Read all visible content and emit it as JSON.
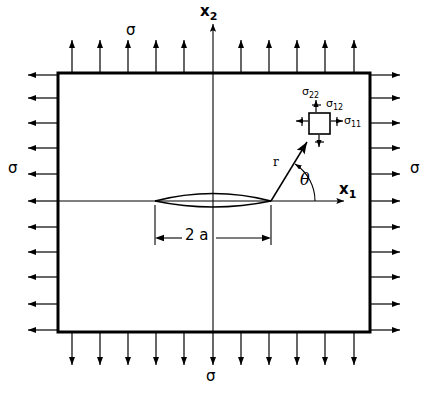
{
  "figure": {
    "type": "engineering-diagram",
    "colors": {
      "ink": "#000000",
      "background": "#ffffff"
    },
    "plate": {
      "x": 58,
      "y": 73,
      "width": 312,
      "height": 259,
      "border_width": 3
    },
    "crack": {
      "half_length_label": "2 a",
      "left_tip_x": 155,
      "right_tip_x": 271,
      "center_y": 201,
      "opening": 11
    },
    "axes": {
      "x1": {
        "label": "x",
        "subscript": "1",
        "from_x": 58,
        "to_x": 347,
        "y": 201
      },
      "x2": {
        "label": "x",
        "subscript": "2",
        "x": 213,
        "from_y": 332,
        "to_y": 22
      }
    },
    "remote_stress": {
      "symbol": "σ",
      "top_label": "σ",
      "bottom_label": "σ",
      "left_label": "σ",
      "right_label": "σ",
      "top_arrow_count": 10,
      "bottom_arrow_count": 11,
      "left_arrow_count": 11,
      "right_arrow_count": 11
    },
    "polar": {
      "radius_label": "r",
      "angle_label": "θ",
      "origin_x": 271,
      "origin_y": 201,
      "tip_x": 311,
      "tip_y": 137,
      "arc_radius": 44
    },
    "stress_element": {
      "x": 309,
      "y": 113,
      "size": 21,
      "components": [
        {
          "name": "sigma-22",
          "base": "σ",
          "subscript": "22",
          "label_x": 303,
          "label_y": 88
        },
        {
          "name": "sigma-12",
          "base": "σ",
          "subscript": "12",
          "label_x": 328,
          "label_y": 99
        },
        {
          "name": "sigma-11",
          "base": "σ",
          "subscript": "11",
          "label_x": 340,
          "label_y": 119
        }
      ]
    },
    "dimension": {
      "label": "2 a",
      "y": 238,
      "left_x": 155,
      "right_x": 271,
      "label_x": 186,
      "label_y": 229
    }
  }
}
